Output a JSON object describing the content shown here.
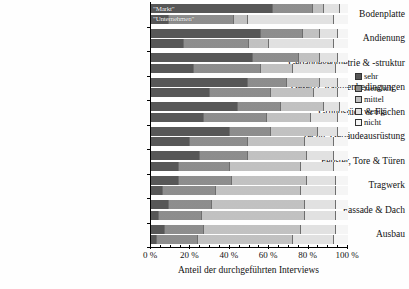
{
  "chart_data": {
    "type": "bar",
    "orientation": "horizontal",
    "stacked": true,
    "title": "",
    "xlabel": "Anteil der durchgeführten Interviews",
    "ylabel": "",
    "xlim": [
      0,
      100
    ],
    "xticklabels": [
      "0 %",
      "20 %",
      "40 %",
      "60 %",
      "80 %",
      "100 %"
    ],
    "xtickvalues": [
      0,
      20,
      40,
      60,
      80,
      100
    ],
    "grid": false,
    "legend_position": "right",
    "legend": [
      "sehr",
      "ziemlich",
      "mittel",
      "wenig",
      "nicht"
    ],
    "group_labels": [
      "\"Markt\"",
      "\"Unternehmen\""
    ],
    "categories": [
      "Bodenplatte",
      "Andienung",
      "Gebäudegeometrie & -struktur",
      "Gesetzl. Rahmenbedingungen",
      "Grundstück & Flächen",
      "Techn. Gebäudeausrüstung",
      "Fenster, Tore & Türen",
      "Tragwerk",
      "Fassade & Dach",
      "Ausbau"
    ],
    "series": [
      {
        "name": "sehr",
        "color": "#575757",
        "markt": [
          62,
          56,
          52,
          49,
          44,
          40,
          25,
          14,
          9,
          7
        ],
        "unternehmen": [
          9,
          17,
          22,
          30,
          27,
          20,
          14,
          6,
          4,
          3
        ]
      },
      {
        "name": "ziemlich",
        "color": "#8e8e8e",
        "markt": [
          20,
          21,
          23,
          20,
          22,
          21,
          24,
          27,
          22,
          20
        ],
        "unternehmen": [
          33,
          33,
          34,
          31,
          32,
          29,
          26,
          27,
          22,
          21
        ]
      },
      {
        "name": "mittel",
        "color": "#c2c2c2",
        "markt": [
          6,
          9,
          11,
          17,
          22,
          24,
          30,
          38,
          47,
          49
        ],
        "unternehmen": [
          7,
          10,
          16,
          22,
          22,
          29,
          36,
          43,
          52,
          48
        ]
      },
      {
        "name": "wenig",
        "color": "#e2e2e2",
        "markt": [
          8,
          9,
          9,
          9,
          8,
          10,
          14,
          15,
          16,
          18
        ],
        "unternehmen": [
          44,
          33,
          22,
          12,
          14,
          15,
          17,
          18,
          16,
          21
        ]
      },
      {
        "name": "nicht",
        "color": "#f6f6f6",
        "markt": [
          4,
          5,
          5,
          5,
          4,
          5,
          7,
          6,
          6,
          6
        ],
        "unternehmen": [
          7,
          7,
          6,
          5,
          5,
          7,
          7,
          6,
          6,
          7
        ]
      }
    ]
  },
  "legend": {
    "items": [
      {
        "label": "sehr",
        "color": "#575757"
      },
      {
        "label": "ziemlich",
        "color": "#8e8e8e"
      },
      {
        "label": "mittel",
        "color": "#c2c2c2"
      },
      {
        "label": "wenig",
        "color": "#e2e2e2"
      },
      {
        "label": "nicht",
        "color": "#f6f6f6"
      }
    ]
  },
  "axis": {
    "x_title": "Anteil der durchgeführten Interviews",
    "x_labels": [
      "0 %",
      "20 %",
      "40 %",
      "60 %",
      "80 %",
      "100 %"
    ]
  },
  "annotations": {
    "markt": "\"Markt\"",
    "unternehmen": "\"Unternehmen\""
  }
}
